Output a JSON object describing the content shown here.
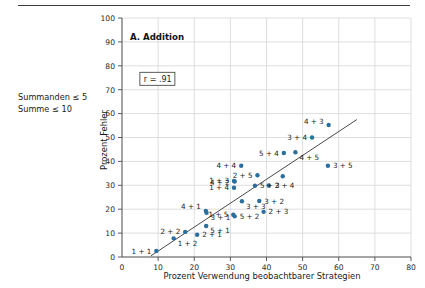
{
  "figure": {
    "side_note": "Summanden ≤ 5\nSumme ≤ 10",
    "panel_title": "A. Addition",
    "correlation_label": "r = .91",
    "marker_color": "#2b6f9e",
    "line_color": "#4a4a4a",
    "grid_color": "#d6d6d6"
  },
  "chart_data": {
    "type": "scatter",
    "title": "A. Addition",
    "xlabel": "Prozent Verwendung beobachtbarer Strategien",
    "ylabel": "Prozent Fehler",
    "xlim": [
      0,
      80
    ],
    "ylim": [
      0,
      100
    ],
    "xticks": [
      0,
      10,
      20,
      30,
      40,
      50,
      60,
      70,
      80
    ],
    "yticks": [
      0,
      10,
      20,
      30,
      40,
      50,
      60,
      70,
      80,
      90,
      100
    ],
    "xtick_labels": [
      "0",
      "10",
      "20",
      "30",
      "40",
      "50",
      "60",
      "70",
      "80"
    ],
    "ytick_labels": [
      "0",
      "10",
      "20",
      "30",
      "40",
      "50",
      "60",
      "70",
      "80",
      "90",
      "100"
    ],
    "grid": true,
    "legend": "none",
    "annotations": [
      {
        "text": "r = .91",
        "x": 5.5,
        "y": 73.5,
        "boxed": true
      }
    ],
    "fit_line": {
      "x0": 8.0,
      "y0": 0.5,
      "x1": 65.0,
      "y1": 57.5
    },
    "points": [
      {
        "label": "1 + 1",
        "x": 9.5,
        "y": 2.5,
        "label_pos": "left"
      },
      {
        "label": "1 + 2",
        "x": 14.3,
        "y": 7.8,
        "label_pos": "below-right"
      },
      {
        "label": "2 + 2",
        "x": 17.5,
        "y": 10.5,
        "label_pos": "left"
      },
      {
        "label": "2 + 1",
        "x": 20.8,
        "y": 9.3,
        "label_pos": "right"
      },
      {
        "label": "5 + 1",
        "x": 23.3,
        "y": 13.0,
        "label_pos": "below-right"
      },
      {
        "label": "3 + 1",
        "x": 23.4,
        "y": 18.5,
        "label_pos": "below-right"
      },
      {
        "label": "4 + 1",
        "x": 23.2,
        "y": 19.3,
        "label_pos": "left-above"
      },
      {
        "label": "1 + 5",
        "x": 30.8,
        "y": 17.7,
        "label_pos": "left"
      },
      {
        "label": "5 + 2",
        "x": 31.2,
        "y": 17.0,
        "label_pos": "right"
      },
      {
        "label": "1 + 4",
        "x": 31.0,
        "y": 29.0,
        "label_pos": "left"
      },
      {
        "label": "1 + 3",
        "x": 31.0,
        "y": 31.8,
        "label_pos": "left"
      },
      {
        "label": "4 + 2",
        "x": 31.2,
        "y": 31.6,
        "label_pos": "left-mid"
      },
      {
        "label": "4 + 4",
        "x": 33.0,
        "y": 38.2,
        "label_pos": "left"
      },
      {
        "label": "3 + 3",
        "x": 33.2,
        "y": 23.3,
        "label_pos": "below-right"
      },
      {
        "label": "2 + 5",
        "x": 37.5,
        "y": 34.2,
        "label_pos": "left"
      },
      {
        "label": "5 + 3",
        "x": 36.8,
        "y": 29.8,
        "label_pos": "right"
      },
      {
        "label": "3 + 2",
        "x": 38.0,
        "y": 23.4,
        "label_pos": "right"
      },
      {
        "label": "2 + 3",
        "x": 39.2,
        "y": 18.9,
        "label_pos": "right"
      },
      {
        "label": "2 + 4",
        "x": 40.6,
        "y": 29.9,
        "label_pos": "right-far"
      },
      {
        "label": "5 + 4",
        "x": 44.8,
        "y": 43.5,
        "label_pos": "left"
      },
      {
        "label": "4 + 5",
        "x": 48.0,
        "y": 43.8,
        "label_pos": "below-right"
      },
      {
        "label": "3 + 4",
        "x": 52.6,
        "y": 50.0,
        "label_pos": "left"
      },
      {
        "label": "3 + 5",
        "x": 57.0,
        "y": 38.2,
        "label_pos": "right"
      },
      {
        "label": "4 + 3",
        "x": 57.2,
        "y": 55.2,
        "label_pos": "left-above"
      },
      {
        "label": "",
        "x": 44.5,
        "y": 33.8,
        "label_pos": "none"
      }
    ]
  }
}
